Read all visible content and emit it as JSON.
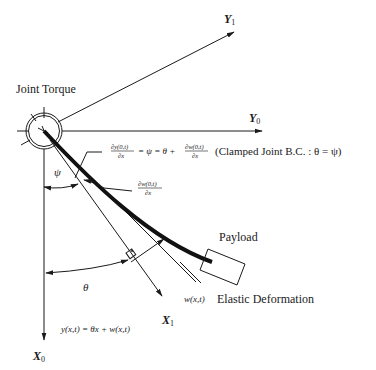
{
  "diagram": {
    "title_label": "Joint Torque",
    "axes": {
      "y1": {
        "name": "Y",
        "sub": "1"
      },
      "y0": {
        "name": "Y",
        "sub": "0"
      },
      "x1": {
        "name": "X",
        "sub": "1"
      },
      "x0": {
        "name": "X",
        "sub": "0"
      }
    },
    "equation_top": {
      "frac1_num": "∂y(0,t)",
      "frac1_den": "∂x",
      "middle": "= ψ = θ +",
      "frac2_num": "∂w(0,t)",
      "frac2_den": "∂x",
      "note": "(Clamped Joint B.C. :  θ = ψ)"
    },
    "equation_mid": {
      "num": "∂w(0,t)",
      "den": "∂x"
    },
    "psi_label": "ψ",
    "theta_label": "θ",
    "payload_label": "Payload",
    "deformation_symbol": "w(x,t)",
    "deformation_label": "Elastic Deformation",
    "equation_bottom": "y(x,t) = θx + w(x,t)"
  }
}
